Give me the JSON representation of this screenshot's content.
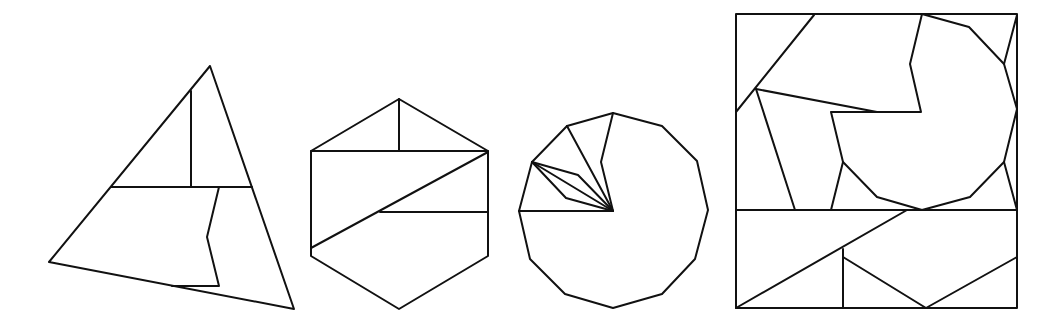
{
  "figures": [
    {
      "name": "triangle-dissection",
      "shape": "triangle",
      "pieces": 4
    },
    {
      "name": "hexagon-dissection",
      "shape": "hexagon",
      "pieces": 5
    },
    {
      "name": "dodecagon-dissection",
      "shape": "dodecagon",
      "pieces": 6
    },
    {
      "name": "square-dissection",
      "shape": "square",
      "pieces": 9
    }
  ],
  "colors": {
    "stroke": "#111111",
    "background": "#ffffff"
  }
}
